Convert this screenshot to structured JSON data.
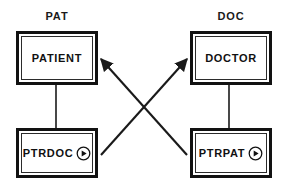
{
  "diagram": {
    "type": "entity-pointer-diagram",
    "background_color": "#ffffff",
    "line_color": "#1a1a1a",
    "groups": [
      {
        "id": "pat",
        "caption": "PAT"
      },
      {
        "id": "doc",
        "caption": "DOC"
      }
    ],
    "boxes": [
      {
        "id": "patient",
        "label": "PATIENT",
        "has_pointer_marker": false
      },
      {
        "id": "doctor",
        "label": "DOCTOR",
        "has_pointer_marker": false
      },
      {
        "id": "ptrdoc",
        "label": "PTRDOC",
        "has_pointer_marker": true
      },
      {
        "id": "ptrpat",
        "label": "PTRPAT",
        "has_pointer_marker": true
      }
    ],
    "icons": {
      "pointer_marker": "play-circle-icon"
    },
    "connectors": [
      {
        "id": "patient-ptrdoc",
        "from": "patient",
        "to": "ptrdoc",
        "style": "plain-vertical",
        "arrow": false
      },
      {
        "id": "doctor-ptrpat",
        "from": "doctor",
        "to": "ptrpat",
        "style": "plain-vertical",
        "arrow": false
      },
      {
        "id": "ptrdoc-doctor",
        "from": "ptrdoc",
        "to": "doctor",
        "style": "diagonal",
        "arrow": true
      },
      {
        "id": "ptrpat-patient",
        "from": "ptrpat",
        "to": "patient",
        "style": "diagonal",
        "arrow": true
      }
    ]
  }
}
